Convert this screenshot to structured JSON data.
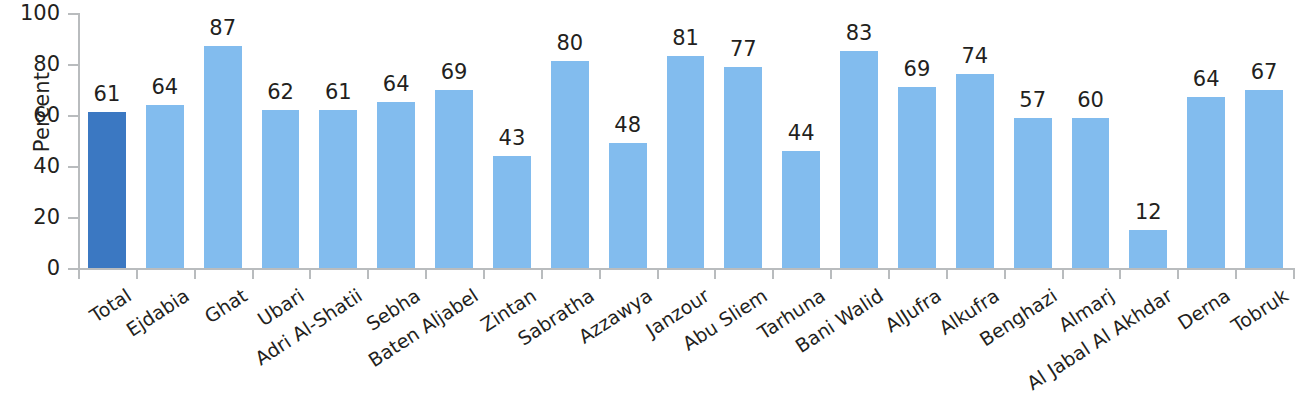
{
  "chart_data": {
    "type": "bar",
    "title": "",
    "subtitle": "",
    "xlabel": "",
    "ylabel": "Percent",
    "ylim": [
      0,
      100
    ],
    "yticks": [
      0,
      20,
      40,
      60,
      80,
      100
    ],
    "grid": false,
    "legend": null,
    "categories": [
      "Total",
      "Ejdabia",
      "Ghat",
      "Ubari",
      "Adri Al-Shatii",
      "Sebha",
      "Baten Aljabel",
      "Zintan",
      "Sabratha",
      "Azzawya",
      "Janzour",
      "Abu Sliem",
      "Tarhuna",
      "Bani Walid",
      "AlJufra",
      "Alkufra",
      "Benghazi",
      "Almarj",
      "Al Jabal Al Akhdar",
      "Derna",
      "Tobruk"
    ],
    "values": [
      61,
      64,
      87,
      62,
      61,
      64,
      69,
      43,
      80,
      48,
      81,
      77,
      44,
      83,
      69,
      74,
      57,
      60,
      12,
      64,
      67
    ],
    "bar_heights": [
      61,
      64,
      87,
      62,
      62,
      65,
      70,
      44,
      81,
      49,
      83,
      79,
      46,
      85,
      71,
      76,
      59,
      59,
      15,
      67,
      70
    ],
    "highlight_index": 0,
    "colors": {
      "total_bar": "#3b78c2",
      "region_bar": "#82bcee",
      "axis": "#b9bcbe",
      "text": "#231f20",
      "background": "#ffffff"
    }
  }
}
